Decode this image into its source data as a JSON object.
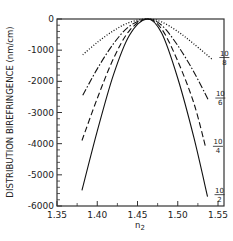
{
  "chart_data": {
    "type": "line",
    "title": "",
    "xlabel": "n2",
    "xlabel_main": "n",
    "xlabel_sub": "2",
    "ylabel": "DISTRIBUTION BIREFRINGENCE (nm/cm)",
    "xlim": [
      1.35,
      1.55
    ],
    "ylim": [
      -6000,
      0
    ],
    "xticks": [
      1.35,
      1.4,
      1.45,
      1.5,
      1.55
    ],
    "xtick_labels": [
      "1.35",
      "1.40",
      "1.45",
      "1.50",
      "1.55"
    ],
    "yticks": [
      0,
      -1000,
      -2000,
      -3000,
      -4000,
      -5000,
      -6000
    ],
    "ytick_labels": [
      "0",
      "-1000",
      "-2000",
      "-3000",
      "-4000",
      "-5000",
      "-6000"
    ],
    "grid": false,
    "peak_x": 1.462,
    "series": [
      {
        "name": "10/2",
        "numerator": "10",
        "denominator": "2",
        "style": "solid",
        "x": [
          1.381,
          1.4,
          1.42,
          1.44,
          1.462,
          1.48,
          1.5,
          1.52,
          1.537
        ],
        "y": [
          -5500,
          -3600,
          -1800,
          -520,
          0,
          -450,
          -1900,
          -3800,
          -5700
        ]
      },
      {
        "name": "10/4",
        "numerator": "10",
        "denominator": "4",
        "style": "dashed",
        "x": [
          1.381,
          1.4,
          1.42,
          1.44,
          1.462,
          1.48,
          1.5,
          1.52,
          1.535
        ],
        "y": [
          -3900,
          -2550,
          -1280,
          -370,
          0,
          -320,
          -1350,
          -2700,
          -4150
        ]
      },
      {
        "name": "10/6",
        "numerator": "10",
        "denominator": "6",
        "style": "dashdot",
        "x": [
          1.382,
          1.4,
          1.42,
          1.44,
          1.462,
          1.48,
          1.5,
          1.52,
          1.538
        ],
        "y": [
          -2450,
          -1600,
          -800,
          -230,
          0,
          -200,
          -850,
          -1700,
          -2600
        ]
      },
      {
        "name": "10/8",
        "numerator": "10",
        "denominator": "8",
        "style": "dotted",
        "x": [
          1.382,
          1.4,
          1.42,
          1.44,
          1.462,
          1.48,
          1.5,
          1.52,
          1.543
        ],
        "y": [
          -1150,
          -750,
          -380,
          -110,
          0,
          -95,
          -400,
          -800,
          -1300
        ]
      }
    ]
  }
}
